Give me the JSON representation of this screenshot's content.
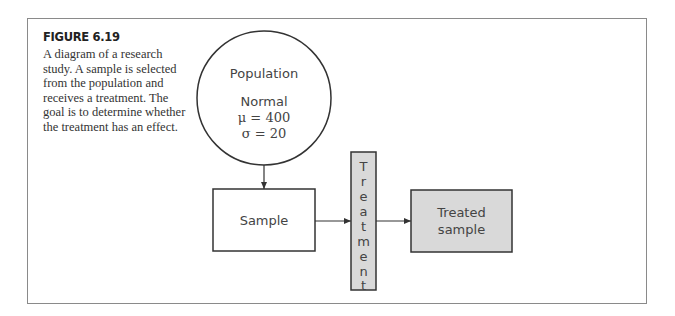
{
  "figure": {
    "title": "FIGURE 6.19",
    "caption_lines": [
      "A diagram of a research",
      "study. A sample is selected",
      "from the population and",
      "receives a treatment. The",
      "goal is to determine whether",
      "the treatment has an effect."
    ]
  },
  "diagram": {
    "population": {
      "title": "Population",
      "distribution": "Normal",
      "mu_line": "μ = 400",
      "sigma_line": "σ = 20"
    },
    "sample": {
      "label": "Sample"
    },
    "treatment": {
      "letters": [
        "T",
        "r",
        "e",
        "a",
        "t",
        "m",
        "e",
        "n",
        "t"
      ],
      "label": "Treatment"
    },
    "treated_sample": {
      "line1": "Treated",
      "line2": "sample"
    },
    "colors": {
      "shaded_fill": "#d9d9d9",
      "stroke": "#333333",
      "frame": "#8a8a8a"
    }
  }
}
